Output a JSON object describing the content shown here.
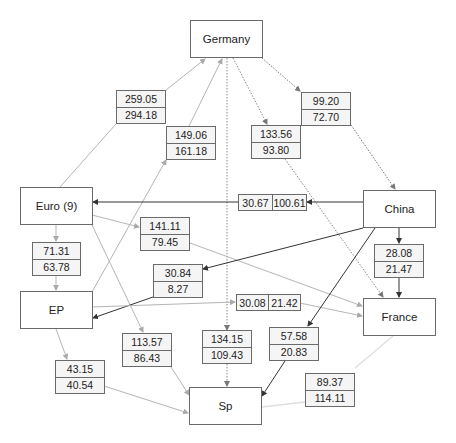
{
  "nodes": {
    "germany": "Germany",
    "euro9": "Euro (9)",
    "china": "China",
    "ep": "EP",
    "france": "France",
    "sp": "Sp"
  },
  "edge_labels": {
    "euro_germany": {
      "top": "259.05",
      "bottom": "294.18"
    },
    "ep_germany": {
      "top": "149.06",
      "bottom": "161.18"
    },
    "germany_france": {
      "top": "133.56",
      "bottom": "93.80"
    },
    "germany_china": {
      "top": "99.20",
      "bottom": "72.70"
    },
    "china_euro": {
      "left": "30.67",
      "right": "100.61"
    },
    "euro_france": {
      "top": "141.11",
      "bottom": "79.45"
    },
    "euro_ep": {
      "top": "71.31",
      "bottom": "63.78"
    },
    "china_france": {
      "top": "28.08",
      "bottom": "21.47"
    },
    "china_ep": {
      "top": "30.84",
      "bottom": "8.27"
    },
    "ep_france": {
      "left": "30.08",
      "right": "21.42"
    },
    "euro_sp": {
      "top": "113.57",
      "bottom": "86.43"
    },
    "germany_sp": {
      "top": "134.15",
      "bottom": "109.43"
    },
    "china_sp": {
      "top": "57.58",
      "bottom": "20.83"
    },
    "ep_sp": {
      "top": "43.15",
      "bottom": "40.54"
    },
    "france_sp": {
      "top": "89.37",
      "bottom": "114.11"
    }
  },
  "colors": {
    "dark_edge": "#333333",
    "mid_edge": "#777777",
    "light_edge": "#b5b5b5",
    "faint_edge": "#dddddd",
    "box_border": "#6a6a6a",
    "label_bg": "#f5f5f5"
  }
}
